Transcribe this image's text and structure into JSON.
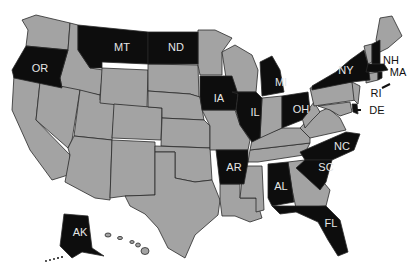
{
  "map": {
    "type": "us-states-choropleth",
    "colors": {
      "highlighted": "#0d0d0d",
      "default": "#a3a3a3",
      "border": "#2a2a2a",
      "background": "#ffffff",
      "label_on_dark": "#e6e6e6",
      "label_on_light": "#111111"
    },
    "highlighted_states": [
      "OR",
      "MT",
      "ND",
      "IA",
      "IL",
      "MI",
      "OH",
      "NY",
      "NH",
      "MA",
      "RI",
      "DE",
      "NC",
      "SC",
      "AR",
      "AL",
      "FL",
      "AK"
    ],
    "labels": {
      "OR": "OR",
      "MT": "MT",
      "ND": "ND",
      "IA": "IA",
      "IL": "IL",
      "MI": "MI",
      "OH": "OH",
      "NY": "NY",
      "NH": "NH",
      "MA": "MA",
      "RI": "RI",
      "DE": "DE",
      "NC": "NC",
      "SC": "SC",
      "AR": "AR",
      "AL": "AL",
      "FL": "FL",
      "AK": "AK"
    }
  }
}
